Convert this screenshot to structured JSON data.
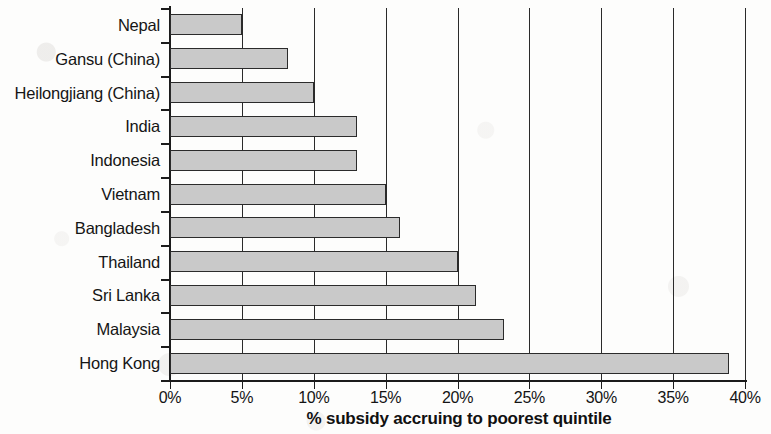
{
  "chart_data": {
    "type": "bar",
    "orientation": "horizontal",
    "title": "",
    "xlabel": "% subsidy accruing to poorest quintile",
    "ylabel": "",
    "xlim": [
      0,
      40
    ],
    "xtick_labels": [
      "0%",
      "5%",
      "10%",
      "15%",
      "20%",
      "25%",
      "30%",
      "35%",
      "40%"
    ],
    "xticks": [
      0,
      5,
      10,
      15,
      20,
      25,
      30,
      35,
      40
    ],
    "grid": true,
    "legend": "none",
    "categories": [
      "Nepal",
      "Gansu (China)",
      "Heilongjiang (China)",
      "India",
      "Indonesia",
      "Vietnam",
      "Bangladesh",
      "Thailand",
      "Sri Lanka",
      "Malaysia",
      "Hong Kong"
    ],
    "values": [
      5.0,
      8.2,
      10.0,
      13.0,
      13.0,
      15.0,
      16.0,
      20.0,
      21.3,
      23.2,
      38.9
    ],
    "bar_fill_color": "#c9c9c9",
    "bar_edge_color": "#2b2b2b",
    "axis_color": "#1b1b1b"
  }
}
